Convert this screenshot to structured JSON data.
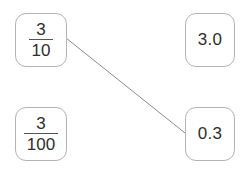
{
  "activity": {
    "type": "matching-line-activity",
    "title": "Match the fraction to its decimal"
  },
  "cards": {
    "left": [
      {
        "id": "three-tenths",
        "kind": "fraction",
        "numerator": "3",
        "denominator": "10",
        "text": "3/10"
      },
      {
        "id": "three-hundredths",
        "kind": "fraction",
        "numerator": "3",
        "denominator": "100",
        "text": "3/100"
      }
    ],
    "right": [
      {
        "id": "three-point-zero",
        "kind": "decimal",
        "text": "3.0"
      },
      {
        "id": "zero-point-three",
        "kind": "decimal",
        "text": "0.3"
      }
    ]
  },
  "connections": [
    {
      "id": "connection-3over10-to-0point3",
      "from": "three-tenths",
      "to": "zero-point-three",
      "x1": 66,
      "y1": 38,
      "x2": 185,
      "y2": 133
    }
  ],
  "style": {
    "card_border": "#b4b4b4",
    "card_background": "#ffffff",
    "text_color": "#2e2e2e",
    "fraction_bar": "#555555",
    "connector_color": "#8c8c8c",
    "page_background": "#ffffff"
  }
}
